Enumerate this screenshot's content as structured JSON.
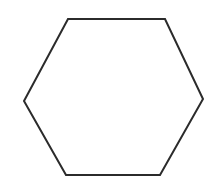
{
  "canvas": {
    "width": 218,
    "height": 195,
    "background_color": "#ffffff",
    "description": "hexagon-line-drawing"
  },
  "shape": {
    "name": "hexagon",
    "sides": 6,
    "fill": "none",
    "fill_color": "#ffffff",
    "stroke_color": "#2b2b2b",
    "stroke_width": 2,
    "orientation": "flat-top",
    "points": "68,19 165,19 203,99 160,175 66,175 24,101",
    "vertices": [
      {
        "label": "top-left",
        "x": 68,
        "y": 19
      },
      {
        "label": "top-right",
        "x": 165,
        "y": 19
      },
      {
        "label": "right",
        "x": 203,
        "y": 99
      },
      {
        "label": "bottom-right",
        "x": 160,
        "y": 175
      },
      {
        "label": "bottom-left",
        "x": 66,
        "y": 175
      },
      {
        "label": "left",
        "x": 24,
        "y": 101
      }
    ],
    "bounding_box": {
      "x": 24,
      "y": 19,
      "width": 179,
      "height": 156
    }
  }
}
